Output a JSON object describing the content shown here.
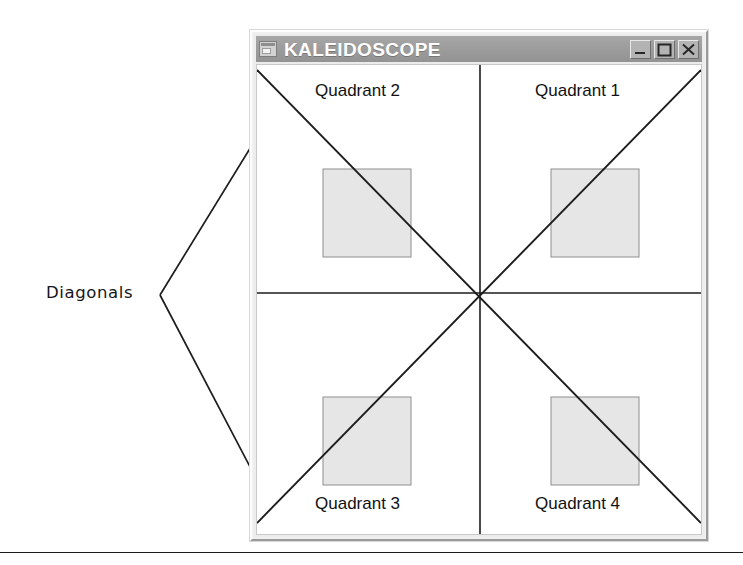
{
  "figure": {
    "annotation": {
      "label": "Diagonals",
      "arrow_targets": [
        "upper-left-diagonal",
        "lower-left-diagonal"
      ]
    },
    "rule": {
      "name": "bottom-horizontal-rule"
    }
  },
  "window": {
    "title": "KALEIDOSCOPE",
    "app_icon": "window-app-icon",
    "controls": [
      {
        "name": "minimize-button",
        "icon": "minimize-icon",
        "glyph": "_"
      },
      {
        "name": "maximize-button",
        "icon": "maximize-icon",
        "glyph": "□"
      },
      {
        "name": "close-button",
        "icon": "close-icon",
        "glyph": "×"
      }
    ],
    "titlebar_color": "#9d9d9d",
    "title_text_color": "#ffffff",
    "frame_color": "#f0f0f0",
    "client_background": "#ffffff"
  },
  "canvas": {
    "quadrant_labels": [
      {
        "name": "quadrant-2-label",
        "text": "Quadrant 2"
      },
      {
        "name": "quadrant-1-label",
        "text": "Quadrant 1"
      },
      {
        "name": "quadrant-3-label",
        "text": "Quadrant 3"
      },
      {
        "name": "quadrant-4-label",
        "text": "Quadrant 4"
      }
    ],
    "axes": {
      "horizontal": "horizontal-axis-line",
      "vertical": "vertical-axis-line",
      "center": {
        "x": 223,
        "y": 228
      }
    },
    "diagonals": [
      "diagonal-top-left-to-bottom-right",
      "diagonal-bottom-left-to-top-right"
    ],
    "squares": [
      {
        "name": "quadrant-2-square",
        "x": 66,
        "y": 104,
        "size": 88
      },
      {
        "name": "quadrant-1-square",
        "x": 294,
        "y": 104,
        "size": 88
      },
      {
        "name": "quadrant-3-square",
        "x": 66,
        "y": 332,
        "size": 88
      },
      {
        "name": "quadrant-4-square",
        "x": 294,
        "y": 332,
        "size": 88
      }
    ],
    "square_fill": "#e6e6e6",
    "square_stroke": "#8e8e8e",
    "line_color": "#1c1c1c"
  }
}
